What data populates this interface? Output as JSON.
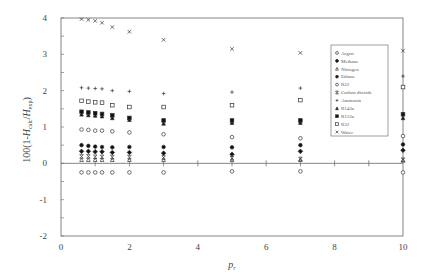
{
  "chart_data": {
    "type": "scatter",
    "title": "",
    "xlabel": "p_r",
    "ylabel": "100(1-H_calc/H_exp)",
    "xlim": [
      0,
      10
    ],
    "ylim": [
      -2,
      4
    ],
    "x_ticks": [
      0,
      2,
      4,
      6,
      8,
      10
    ],
    "y_ticks": [
      -2,
      -1,
      0,
      1,
      2,
      3,
      4
    ],
    "grid": false,
    "zero_line": true,
    "legend_position": "upper right (inside)",
    "x": [
      0.6,
      0.8,
      1.0,
      1.2,
      1.5,
      2.0,
      3.0,
      5.0,
      7.0,
      10.0
    ],
    "series": [
      {
        "name": "Argon",
        "marker": "open-circle",
        "values": [
          -0.25,
          -0.25,
          -0.25,
          -0.25,
          -0.25,
          -0.25,
          -0.25,
          -0.22,
          -0.22,
          -0.25
        ]
      },
      {
        "name": "Methane",
        "marker": "filled-diamond",
        "values": [
          0.33,
          0.33,
          0.32,
          0.32,
          0.3,
          0.3,
          0.28,
          0.25,
          0.33,
          0.36
        ]
      },
      {
        "name": "Nitrogen",
        "marker": "open-triangle",
        "values": [
          0.1,
          0.1,
          0.1,
          0.1,
          0.1,
          0.1,
          0.1,
          0.1,
          0.1,
          0.08
        ]
      },
      {
        "name": "Ethane",
        "marker": "filled-circle",
        "values": [
          0.5,
          0.48,
          0.46,
          0.45,
          0.44,
          0.45,
          0.45,
          0.44,
          0.5,
          0.52
        ]
      },
      {
        "name": "R22",
        "marker": "open-circle",
        "values": [
          0.93,
          0.92,
          0.9,
          0.9,
          0.88,
          0.85,
          0.8,
          0.72,
          0.69,
          0.75
        ]
      },
      {
        "name": "Carbon dioxide",
        "marker": "x-box",
        "values": [
          0.19,
          0.19,
          0.18,
          0.18,
          0.17,
          0.17,
          0.16,
          0.14,
          0.12,
          0.1
        ]
      },
      {
        "name": "Ammonia",
        "marker": "plus",
        "values": [
          2.08,
          2.07,
          2.06,
          2.05,
          2.0,
          1.98,
          1.92,
          1.96,
          2.07,
          2.4
        ]
      },
      {
        "name": "R143a",
        "marker": "filled-triangle",
        "values": [
          1.35,
          1.33,
          1.32,
          1.3,
          1.25,
          1.2,
          1.1,
          1.12,
          1.12,
          1.25
        ]
      },
      {
        "name": "R152a",
        "marker": "filled-square",
        "values": [
          1.42,
          1.4,
          1.38,
          1.36,
          1.32,
          1.25,
          1.18,
          1.18,
          1.18,
          1.35
        ]
      },
      {
        "name": "R32",
        "marker": "open-square",
        "values": [
          1.72,
          1.7,
          1.68,
          1.67,
          1.6,
          1.55,
          1.55,
          1.6,
          1.74,
          2.1
        ]
      },
      {
        "name": "Water",
        "marker": "x",
        "values": [
          3.97,
          3.95,
          3.92,
          3.87,
          3.75,
          3.62,
          3.4,
          3.15,
          3.04,
          3.1
        ]
      }
    ]
  },
  "axes": {
    "x_title_main": "p",
    "x_title_sub": "r",
    "y_title_prefix": "100(1-",
    "y_title_H1": "H",
    "y_title_sub1": "calc",
    "y_title_slash": "/",
    "y_title_H2": "H",
    "y_title_sub2": "exp",
    "y_title_suffix": ")"
  }
}
